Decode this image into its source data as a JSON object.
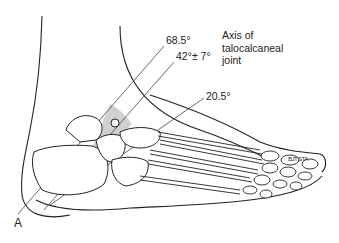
{
  "figure": {
    "panel_letter": "A",
    "axis_label": {
      "lines": [
        "Axis of",
        "talocalcaneal",
        "joint"
      ]
    },
    "angles": [
      {
        "label": "68.5°",
        "x": 166,
        "y": 40
      },
      {
        "label": "42°± 7°",
        "x": 176,
        "y": 56
      },
      {
        "label": "20.5°",
        "x": 206,
        "y": 92
      }
    ],
    "signature": "BJT STA",
    "colors": {
      "line": "#222222",
      "shade": "#c8c8c8",
      "background": "#ffffff"
    }
  }
}
